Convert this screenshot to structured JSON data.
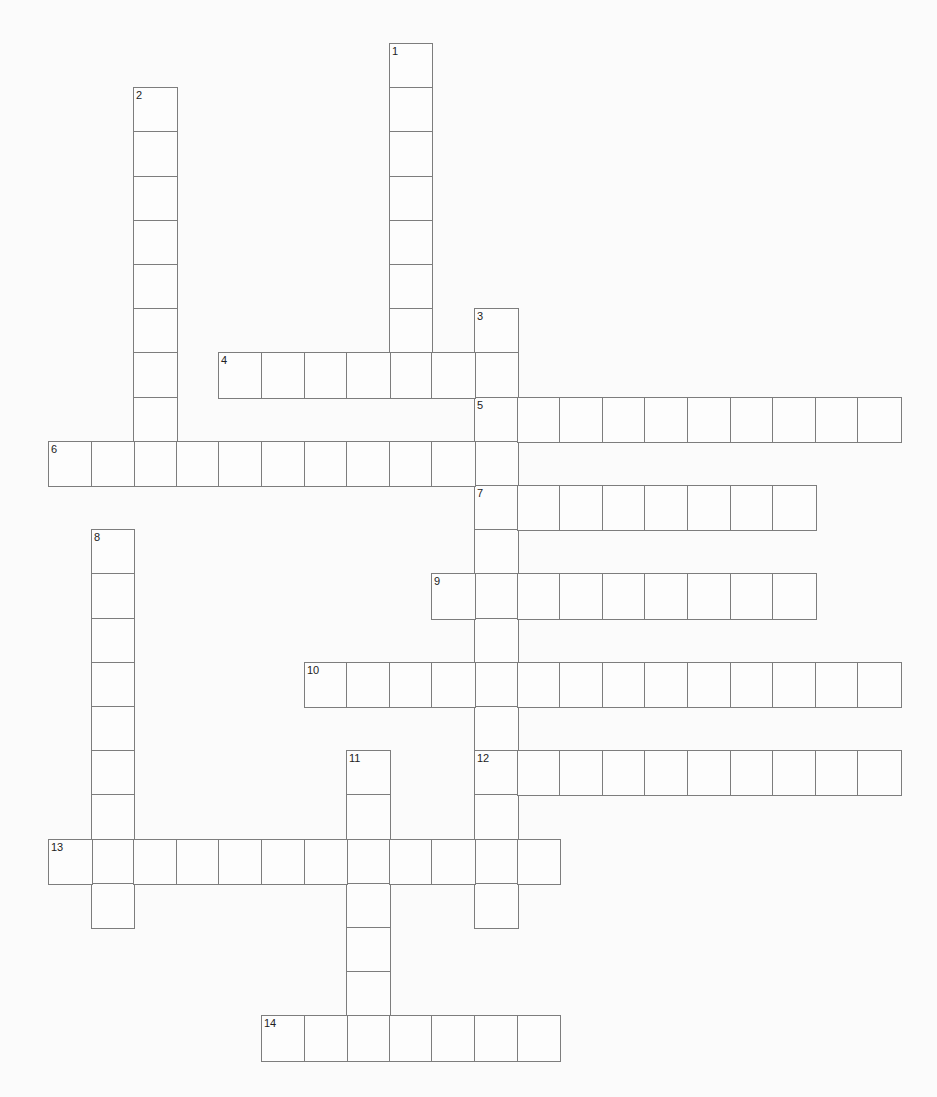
{
  "puzzle": {
    "type": "crossword",
    "grid": {
      "origin_x": 48,
      "origin_y": 43,
      "cell_width": 42.6,
      "cell_height": 44.2,
      "line_color": "#7d7d7d",
      "background": "#fbfbfb"
    },
    "entries": [
      {
        "number": "1",
        "direction": "down",
        "row": 0,
        "col": 8,
        "length": 8
      },
      {
        "number": "2",
        "direction": "down",
        "row": 1,
        "col": 2,
        "length": 9
      },
      {
        "number": "3",
        "direction": "down",
        "row": 6,
        "col": 10,
        "length": 14
      },
      {
        "number": "4",
        "direction": "across",
        "row": 7,
        "col": 4,
        "length": 7
      },
      {
        "number": "5",
        "direction": "across",
        "row": 8,
        "col": 10,
        "length": 10
      },
      {
        "number": "6",
        "direction": "across",
        "row": 9,
        "col": 0,
        "length": 11
      },
      {
        "number": "7",
        "direction": "across",
        "row": 10,
        "col": 10,
        "length": 8
      },
      {
        "number": "8",
        "direction": "down",
        "row": 11,
        "col": 1,
        "length": 9
      },
      {
        "number": "9",
        "direction": "across",
        "row": 12,
        "col": 9,
        "length": 9
      },
      {
        "number": "10",
        "direction": "across",
        "row": 14,
        "col": 6,
        "length": 14
      },
      {
        "number": "11",
        "direction": "down",
        "row": 16,
        "col": 7,
        "length": 7
      },
      {
        "number": "12",
        "direction": "across",
        "row": 16,
        "col": 10,
        "length": 10
      },
      {
        "number": "13",
        "direction": "across",
        "row": 18,
        "col": 0,
        "length": 12
      },
      {
        "number": "14",
        "direction": "across",
        "row": 22,
        "col": 5,
        "length": 7
      }
    ]
  }
}
